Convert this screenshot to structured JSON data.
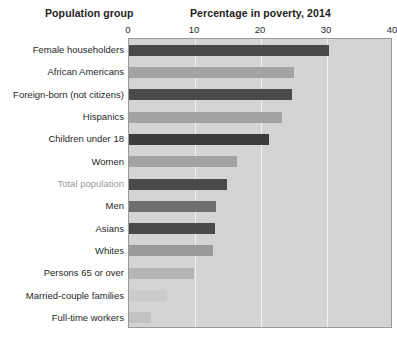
{
  "header": {
    "group_title": "Population group",
    "value_title": "Percentage in poverty, 2014"
  },
  "axis": {
    "ticks": [
      "0",
      "10",
      "20",
      "30",
      "40"
    ],
    "tick_values": [
      0,
      10,
      20,
      30,
      40
    ]
  },
  "colors": {
    "plot_background": "#d4d4d4",
    "gridline": "#f2f2f2",
    "bar_dark": "#4a4a4a",
    "bar_medium": "#a3a3a3",
    "bar_light": "#c6c6c6",
    "label": "#1f1f1f",
    "label_muted": "#9b9b9b",
    "plot_border": "#9a9a9a"
  },
  "chart_data": {
    "type": "bar",
    "orientation": "horizontal",
    "title": "Percentage in poverty, 2014",
    "xlabel": "Percentage in poverty, 2014",
    "ylabel": "Population group",
    "xlim": [
      0,
      40
    ],
    "xticks": [
      0,
      10,
      20,
      30,
      40
    ],
    "grid": true,
    "legend": false,
    "categories": [
      "Female householders",
      "African Americans",
      "Foreign-born (not citizens)",
      "Hispanics",
      "Children under 18",
      "Women",
      "Total population",
      "Men",
      "Asians",
      "Whites",
      "Persons 65 or over",
      "Married-couple families",
      "Full-time workers"
    ],
    "values": [
      30.3,
      25.0,
      24.7,
      23.2,
      21.2,
      16.4,
      14.8,
      13.2,
      13.1,
      12.7,
      9.9,
      5.7,
      3.3
    ],
    "bar_colors": [
      "#4a4a4a",
      "#a3a3a3",
      "#4a4a4a",
      "#a3a3a3",
      "#3d3d3d",
      "#a3a3a3",
      "#4a4a4a",
      "#6f6f6f",
      "#4a4a4a",
      "#9a9a9a",
      "#b5b5b5",
      "#cccccc",
      "#c2c2c2"
    ],
    "label_muted_index": 6
  }
}
